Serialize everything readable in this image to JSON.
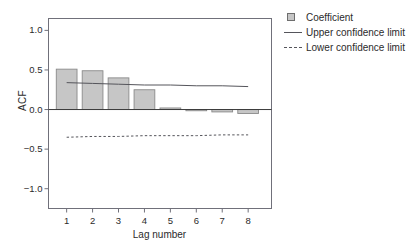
{
  "chart_data": {
    "type": "bar",
    "title": "",
    "xlabel": "Lag number",
    "ylabel": "ACF",
    "categories": [
      "1",
      "2",
      "3",
      "4",
      "5",
      "6",
      "7",
      "8"
    ],
    "values": [
      0.51,
      0.49,
      0.4,
      0.25,
      0.02,
      -0.01,
      -0.03,
      -0.05
    ],
    "series": [
      {
        "name": "Coefficient",
        "type": "bar",
        "values": [
          0.51,
          0.49,
          0.4,
          0.25,
          0.02,
          -0.01,
          -0.03,
          -0.05
        ]
      },
      {
        "name": "Upper confidence limit",
        "type": "line",
        "style": "solid",
        "values": [
          0.34,
          0.33,
          0.32,
          0.31,
          0.31,
          0.3,
          0.3,
          0.29
        ]
      },
      {
        "name": "Lower confidence limit",
        "type": "line",
        "style": "dashed",
        "values": [
          -0.35,
          -0.34,
          -0.34,
          -0.33,
          -0.33,
          -0.33,
          -0.32,
          -0.32
        ]
      }
    ],
    "ylim": [
      -1.25,
      1.15
    ],
    "xlim": [
      0.3,
      8.9
    ],
    "yticks": [
      1.0,
      0.5,
      0.0,
      -0.5,
      -1.0
    ],
    "ytick_labels": [
      "1.0",
      "0.5",
      "0.0",
      "−0.5",
      "−1.0"
    ],
    "xticks": [
      1,
      2,
      3,
      4,
      5,
      6,
      7,
      8
    ],
    "xtick_labels": [
      "1",
      "2",
      "3",
      "4",
      "5",
      "6",
      "7",
      "8"
    ],
    "grid": false,
    "zero_line": true,
    "legend_position": "top-right",
    "legend": [
      {
        "label": "Coefficient",
        "key": "filled-square",
        "color": "#c6c6c6"
      },
      {
        "label": "Upper confidence limit",
        "key": "solid-line",
        "color": "#55555b"
      },
      {
        "label": "Lower confidence limit",
        "key": "dashed-line",
        "color": "#55555b"
      }
    ],
    "colors": {
      "bar_fill": "#c6c6c6",
      "bar_stroke": "#8a8a8a",
      "axis": "#70707a",
      "line": "#55555b",
      "text": "#2b2b2b",
      "background": "#ffffff"
    }
  }
}
